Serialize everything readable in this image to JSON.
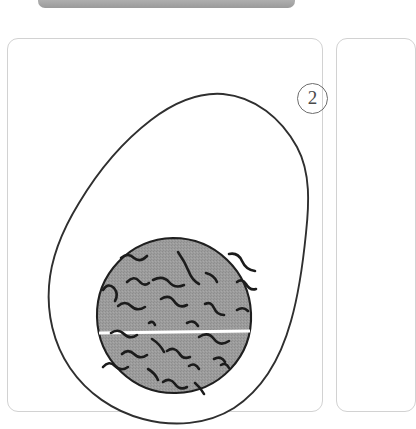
{
  "window": {
    "top_bar": {
      "icon": "window-title-bar",
      "color": "#b4b4b4"
    }
  },
  "cards": [
    {
      "name": "instruction-card-2",
      "step_number": "2",
      "illustration": {
        "name": "egg-cross-section-illustration",
        "description": "hand-drawn outline of a halved egg with a shaded speckled yolk",
        "outline_color": "#2b2b2b",
        "fill_color": "#9a9a9a",
        "divider_color": "#ffffff",
        "speckle_count": 26
      }
    },
    {
      "name": "instruction-card-next",
      "step_number": "",
      "illustration": null
    }
  ],
  "colors": {
    "card_border": "#d2d2d2",
    "page_background": "#ffffff",
    "ink": "#2b2b2b",
    "shade": "#9a9a9a",
    "badge_ink": "#4a4a4a"
  }
}
